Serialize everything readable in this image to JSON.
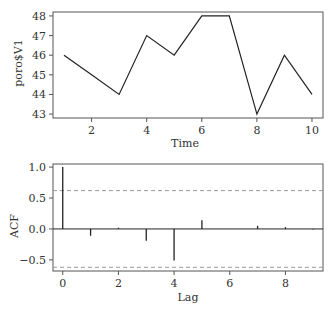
{
  "chart_data": [
    {
      "type": "line",
      "title": "",
      "xlabel": "Time",
      "ylabel": "poro$V1",
      "x": [
        1,
        2,
        3,
        4,
        5,
        6,
        7,
        8,
        9,
        10
      ],
      "values": [
        46,
        45,
        44,
        47,
        46,
        48,
        48,
        43,
        46,
        44
      ],
      "xlim": [
        0.6,
        10.4
      ],
      "ylim": [
        42.8,
        48.2
      ],
      "xticks": [
        "2",
        "4",
        "6",
        "8",
        "10"
      ],
      "yticks": [
        "43",
        "44",
        "45",
        "46",
        "47",
        "48"
      ],
      "grid": false
    },
    {
      "type": "bar",
      "subtype": "acf",
      "title": "",
      "xlabel": "Lag",
      "ylabel": "ACF",
      "categories": [
        0,
        1,
        2,
        3,
        4,
        5,
        6,
        7,
        8,
        9
      ],
      "values": [
        1.0,
        -0.11,
        0.02,
        -0.19,
        -0.51,
        0.14,
        0.0,
        0.05,
        0.03,
        -0.01
      ],
      "confidence_bounds": [
        0.62,
        -0.62
      ],
      "xlim": [
        -0.35,
        9.35
      ],
      "ylim": [
        -0.68,
        1.05
      ],
      "xticks": [
        "0",
        "2",
        "4",
        "6",
        "8"
      ],
      "yticks": [
        "-0.5",
        "0.0",
        "0.5",
        "1.0"
      ],
      "grid": false
    }
  ],
  "top": {
    "xlabel": "Time",
    "ylabel": "poro$V1"
  },
  "bottom": {
    "xlabel": "Lag",
    "ylabel": "ACF"
  }
}
